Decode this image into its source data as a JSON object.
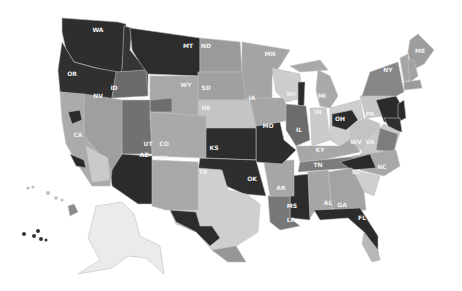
{
  "map": {
    "title": "",
    "type": "choropleth",
    "palette": {
      "darkest": "#2a2a2a",
      "dark": "#5e5e5e",
      "mid_dark": "#7a7a7a",
      "mid": "#969696",
      "light": "#b4b4b4",
      "lighter": "#cdcdcd",
      "lightest": "#ececec"
    },
    "states": [
      {
        "code": "WA",
        "label": "WA",
        "shade": "#2e2e2e",
        "points": "62,18 118,22 126,24 122,74 96,68 74,62 66,50 62,32",
        "lx": 98,
        "ly": 32
      },
      {
        "code": "OR",
        "label": "OR",
        "shade": "#303030",
        "points": "62,42 74,62 96,68 118,72 112,100 60,92 58,70",
        "lx": 72,
        "ly": 76
      },
      {
        "code": "ID",
        "label": "ID",
        "shade": "#353535",
        "points": "124,26 132,28 130,50 138,60 148,64 148,94 112,98 116,78 122,70",
        "lx": 114,
        "ly": 90
      },
      {
        "code": "IDs",
        "label": "",
        "shade": "#6a6a6a",
        "points": "116,72 146,70 148,96 112,98",
        "lx": 0,
        "ly": 0
      },
      {
        "code": "MT",
        "label": "MT",
        "shade": "#2c2c2c",
        "points": "130,28 200,38 200,76 148,74 138,60 132,50",
        "lx": 188,
        "ly": 48
      },
      {
        "code": "ND",
        "label": "ND",
        "shade": "#9a9a9a",
        "points": "200,38 240,42 242,72 200,72",
        "lx": 206,
        "ly": 48
      },
      {
        "code": "WY",
        "label": "WY",
        "shade": "#a8a8a8",
        "points": "150,76 198,76 198,116 150,112",
        "lx": 186,
        "ly": 87
      },
      {
        "code": "WYd",
        "label": "",
        "shade": "#6e6e6e",
        "points": "150,100 172,98 172,112 150,112",
        "lx": 0,
        "ly": 0
      },
      {
        "code": "SD",
        "label": "SD",
        "shade": "#a0a0a0",
        "points": "198,72 244,72 246,100 198,100",
        "lx": 206,
        "ly": 90
      },
      {
        "code": "NE",
        "label": "NE",
        "shade": "#c4c4c4",
        "points": "198,100 250,100 258,128 206,128 198,116",
        "lx": 206,
        "ly": 110
      },
      {
        "code": "MN",
        "label": "MN",
        "shade": "#a4a4a4",
        "points": "242,42 290,50 280,66 272,76 272,98 246,100 242,72",
        "lx": 270,
        "ly": 56
      },
      {
        "code": "IA",
        "label": "IA",
        "shade": "#a6a6a6",
        "points": "246,98 284,98 290,120 256,126 250,100",
        "lx": 252,
        "ly": 100
      },
      {
        "code": "WI",
        "label": "WI",
        "shade": "#cdcdcd",
        "points": "272,68 300,74 302,98 286,102 276,92",
        "lx": 291,
        "ly": 96
      },
      {
        "code": "WIe",
        "label": "",
        "shade": "#2c2c2c",
        "points": "298,82 305,82 304,106 298,106",
        "lx": 0,
        "ly": 0
      },
      {
        "code": "MI",
        "label": "MI",
        "shade": "#a9a9a9",
        "points": "318,70 330,76 338,96 330,108 320,106 316,90",
        "lx": 322,
        "ly": 98
      },
      {
        "code": "MIu",
        "label": "",
        "shade": "#a9a9a9",
        "points": "290,66 320,60 328,70 300,72",
        "lx": 0,
        "ly": 0
      },
      {
        "code": "IL",
        "label": "IL",
        "shade": "#6c6c6c",
        "points": "286,104 306,106 310,140 296,146 286,130",
        "lx": 299,
        "ly": 132
      },
      {
        "code": "IN",
        "label": "IN",
        "shade": "#cbcbcb",
        "points": "310,108 326,108 330,140 312,146",
        "lx": 318,
        "ly": 114
      },
      {
        "code": "OH",
        "label": "OH",
        "shade": "#cecece",
        "points": "330,108 360,100 366,130 340,146 330,140",
        "lx": 340,
        "ly": 121
      },
      {
        "code": "OHd",
        "label": "",
        "shade": "#2c2c2c",
        "points": "332,114 352,110 358,120 346,130 332,126",
        "lx": 0,
        "ly": 0
      },
      {
        "code": "KY",
        "label": "KY",
        "shade": "#a7a7a7",
        "points": "296,146 312,146 340,146 352,138 360,152 322,160 300,162",
        "lx": 320,
        "ly": 152
      },
      {
        "code": "TN",
        "label": "TN",
        "shade": "#7c7c7c",
        "points": "300,162 360,156 352,168 298,172",
        "lx": 318,
        "ly": 167
      },
      {
        "code": "PA",
        "label": "PA",
        "shade": "#c6c6c6",
        "points": "360,96 396,94 400,114 366,118",
        "lx": 370,
        "ly": 116
      },
      {
        "code": "PAd",
        "label": "",
        "shade": "#2b2b2b",
        "points": "376,100 396,96 404,110 398,122 384,122",
        "lx": 0,
        "ly": 0
      },
      {
        "code": "NY",
        "label": "NY",
        "shade": "#868686",
        "points": "370,72 398,62 404,92 396,96 362,96",
        "lx": 388,
        "ly": 72
      },
      {
        "code": "VT",
        "label": "",
        "shade": "#a6a6a6",
        "points": "400,58 408,54 410,80 404,82",
        "lx": 0,
        "ly": 0
      },
      {
        "code": "ME",
        "label": "ME",
        "shade": "#9d9d9d",
        "points": "410,40 418,34 434,50 424,64 412,70 408,52",
        "lx": 420,
        "ly": 53
      },
      {
        "code": "NH",
        "label": "",
        "shade": "#a2a2a2",
        "points": "408,60 414,60 418,76 410,82",
        "lx": 0,
        "ly": 0
      },
      {
        "code": "MA",
        "label": "",
        "shade": "#9a9a9a",
        "points": "404,82 420,80 422,88 404,90",
        "lx": 0,
        "ly": 0
      },
      {
        "code": "NJ",
        "label": "",
        "shade": "#2a2a2a",
        "points": "398,104 404,100 406,118 398,122",
        "lx": 0,
        "ly": 0
      },
      {
        "code": "MD",
        "label": "",
        "shade": "#2e2e2e",
        "points": "384,118 400,118 402,132 390,130",
        "lx": 0,
        "ly": 0
      },
      {
        "code": "WV",
        "label": "WV",
        "shade": "#c3c3c3",
        "points": "352,126 366,118 380,124 374,146 360,150 350,140",
        "lx": 356,
        "ly": 144
      },
      {
        "code": "VA",
        "label": "VA",
        "shade": "#c9c9c9",
        "points": "366,140 384,124 400,132 394,150 360,156",
        "lx": 370,
        "ly": 144
      },
      {
        "code": "VAe",
        "label": "",
        "shade": "#7d7d7d",
        "points": "380,128 398,134 394,152 376,150",
        "lx": 0,
        "ly": 0
      },
      {
        "code": "NC",
        "label": "NC",
        "shade": "#a8a8a8",
        "points": "352,156 396,150 400,166 384,176 360,170",
        "lx": 382,
        "ly": 169
      },
      {
        "code": "NCd",
        "label": "",
        "shade": "#2a2a2a",
        "points": "340,162 370,154 376,168 352,170",
        "lx": 0,
        "ly": 0
      },
      {
        "code": "SC",
        "label": "SC",
        "shade": "#cfcfcf",
        "points": "352,170 380,176 374,196 356,188",
        "lx": 356,
        "ly": 174
      },
      {
        "code": "GA",
        "label": "GA",
        "shade": "#a3a3a3",
        "points": "328,172 352,168 364,192 366,210 340,212 332,208",
        "lx": 342,
        "ly": 207
      },
      {
        "code": "AL",
        "label": "AL",
        "shade": "#a6a6a6",
        "points": "308,172 328,170 332,210 314,212 310,218",
        "lx": 328,
        "ly": 205
      },
      {
        "code": "MS",
        "label": "MS",
        "shade": "#2c2c2c",
        "points": "290,176 308,174 310,220 290,218",
        "lx": 292,
        "ly": 208
      },
      {
        "code": "LA",
        "label": "LA",
        "shade": "#777777",
        "points": "268,196 290,196 290,218 300,226 280,230 270,222",
        "lx": 291,
        "ly": 222
      },
      {
        "code": "AR",
        "label": "AR",
        "shade": "#a6a6a6",
        "points": "264,162 294,160 294,196 270,196",
        "lx": 281,
        "ly": 190
      },
      {
        "code": "FL",
        "label": "FL",
        "shade": "#2b2b2b",
        "points": "314,210 360,208 378,236 378,250 372,254 364,232 348,218 320,220",
        "lx": 362,
        "ly": 220
      },
      {
        "code": "FLs",
        "label": "",
        "shade": "#b8b8b8",
        "points": "364,232 378,250 380,260 372,262 362,244",
        "lx": 0,
        "ly": 0
      },
      {
        "code": "MO",
        "label": "MO",
        "shade": "#2e2e2e",
        "points": "256,126 280,122 284,140 296,150 282,164 256,162",
        "lx": 268,
        "ly": 128
      },
      {
        "code": "KS",
        "label": "KS",
        "shade": "#2d2d2d",
        "points": "206,128 256,128 256,160 204,158",
        "lx": 214,
        "ly": 150
      },
      {
        "code": "OK",
        "label": "OK",
        "shade": "#2e2e2e",
        "points": "200,158 256,160 266,196 244,194 226,186 220,170 198,170",
        "lx": 252,
        "ly": 181
      },
      {
        "code": "TX",
        "label": "TX",
        "shade": "#cfcfcf",
        "points": "198,168 222,170 228,190 246,194 260,204 258,232 236,246 228,262 212,250 196,232 176,224 170,210 198,210",
        "lx": 203,
        "ly": 174
      },
      {
        "code": "TXd",
        "label": "",
        "shade": "#2c2c2c",
        "points": "170,210 196,212 200,226 212,226 220,238 210,246 196,232 176,222",
        "lx": 0,
        "ly": 0
      },
      {
        "code": "TXm",
        "label": "",
        "shade": "#969696",
        "points": "212,250 236,246 246,262 228,262",
        "lx": 0,
        "ly": 0
      },
      {
        "code": "NM",
        "label": "NM",
        "shade": "#a8a8a8",
        "points": "152,160 198,162 198,210 166,210 152,206",
        "lx": 162,
        "ly": 160
      },
      {
        "code": "CO",
        "label": "CO",
        "shade": "#a9a9a9",
        "points": "150,112 206,116 206,158 152,156",
        "lx": 164,
        "ly": 146
      },
      {
        "code": "UT",
        "label": "UT",
        "shade": "#717171",
        "points": "120,100 150,100 150,116 152,154 122,154",
        "lx": 148,
        "ly": 146
      },
      {
        "code": "AZ",
        "label": "AZ",
        "shade": "#2b2b2b",
        "points": "122,154 152,156 152,204 138,204 112,186 110,170",
        "lx": 144,
        "ly": 157
      },
      {
        "code": "NV",
        "label": "NV",
        "shade": "#9f9f9f",
        "points": "84,94 122,100 122,154 112,170 84,136",
        "lx": 98,
        "ly": 98
      },
      {
        "code": "CA",
        "label": "CA",
        "shade": "#ababab",
        "points": "60,92 84,94 84,136 112,170 110,186 92,186 80,168 66,144 62,120",
        "lx": 78,
        "ly": 137
      },
      {
        "code": "CAd",
        "label": "",
        "shade": "#2a2a2a",
        "points": "68,112 80,110 82,120 72,124",
        "lx": 0,
        "ly": 0
      },
      {
        "code": "CAs",
        "label": "",
        "shade": "#2a2a2a",
        "points": "70,154 84,160 86,168 76,166",
        "lx": 0,
        "ly": 0
      },
      {
        "code": "CAl",
        "label": "",
        "shade": "#cacaca",
        "points": "86,146 108,158 110,180 92,182",
        "lx": 0,
        "ly": 0
      },
      {
        "code": "HI",
        "label": "",
        "shade": "#8a8a8a",
        "points": "68,206 74,204 78,212 70,216",
        "lx": 0,
        "ly": 0
      },
      {
        "code": "AK",
        "label": "",
        "shade": "#ebebeb",
        "points": "96,206 122,202 134,214 140,236 160,246 164,274 146,258 128,256 112,268 78,274 100,260 88,238",
        "lx": 0,
        "ly": 0
      }
    ],
    "islands": [
      {
        "shade": "#bdbdbd",
        "cx": 28,
        "cy": 188,
        "r": 1.6
      },
      {
        "shade": "#bdbdbd",
        "cx": 33,
        "cy": 187,
        "r": 1.6
      },
      {
        "shade": "#bdbdbd",
        "cx": 48,
        "cy": 193,
        "r": 2
      },
      {
        "shade": "#bdbdbd",
        "cx": 56,
        "cy": 198,
        "r": 1.8
      },
      {
        "shade": "#bdbdbd",
        "cx": 62,
        "cy": 200,
        "r": 1.6
      },
      {
        "shade": "#333333",
        "cx": 24,
        "cy": 234,
        "r": 2
      },
      {
        "shade": "#333333",
        "cx": 34,
        "cy": 236,
        "r": 2
      },
      {
        "shade": "#333333",
        "cx": 38,
        "cy": 231,
        "r": 2
      },
      {
        "shade": "#333333",
        "cx": 41,
        "cy": 239,
        "r": 2
      },
      {
        "shade": "#333333",
        "cx": 46,
        "cy": 240,
        "r": 1.5
      }
    ]
  }
}
